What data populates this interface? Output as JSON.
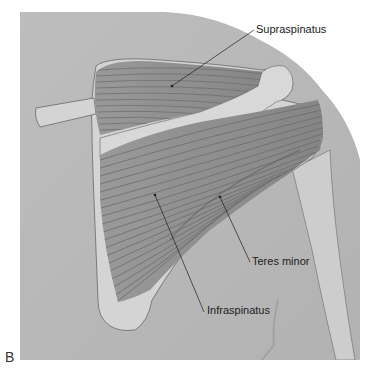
{
  "figure": {
    "panel_letter": "B",
    "labels": [
      {
        "text": "Supraspinatus",
        "x": 256,
        "y": 24,
        "pointer": [
          172,
          86
        ]
      },
      {
        "text": "Teres minor",
        "x": 252,
        "y": 254,
        "pointer": [
          220,
          197
        ]
      },
      {
        "text": "Infraspinatus",
        "x": 207,
        "y": 305,
        "pointer": [
          155,
          195
        ]
      }
    ],
    "colors": {
      "background": "#ffffff",
      "skin": "#b9b9b9",
      "bone": "#d6d6d6",
      "muscle": "#8e8e8e",
      "muscle_fiber": "#6f6f6f",
      "outline": "#5a5a5a",
      "text": "#222222"
    }
  }
}
